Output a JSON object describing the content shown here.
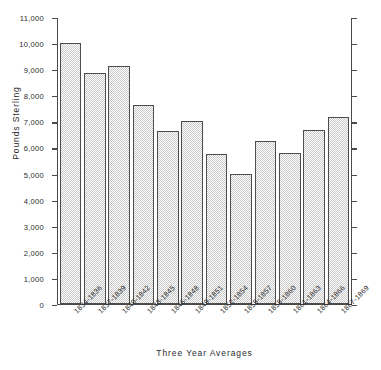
{
  "chart_data": {
    "type": "bar",
    "title": "",
    "xlabel": "Three Year Averages",
    "ylabel": "Pounds Sterling",
    "categories": [
      "1834-1836",
      "1837-1839",
      "1840-1842",
      "1843-1845",
      "1846-1848",
      "1849-1851",
      "1852-1854",
      "1855-1857",
      "1858-1860",
      "1861-1863",
      "1864-1866",
      "1867-1869"
    ],
    "values": [
      10050,
      8900,
      9150,
      7650,
      6650,
      7050,
      5750,
      5000,
      6250,
      5800,
      6700,
      7200
    ],
    "ylim": [
      0,
      11000
    ],
    "ytick_values": [
      0,
      1000,
      2000,
      3000,
      4000,
      5000,
      6000,
      7000,
      8000,
      9000,
      10000,
      11000
    ],
    "ytick_labels": [
      "0",
      "1,000",
      "2,000",
      "3,000",
      "4,000",
      "5,000",
      "6,000",
      "7,000",
      "8,000",
      "9,000",
      "10,000",
      "11,000"
    ],
    "grid": false,
    "legend": null,
    "bar_fill_color": "#c9c9c9",
    "bar_edge_color": "#4d4d4d",
    "axis_color": "#4a4a4a",
    "background_color": "#ffffff"
  }
}
